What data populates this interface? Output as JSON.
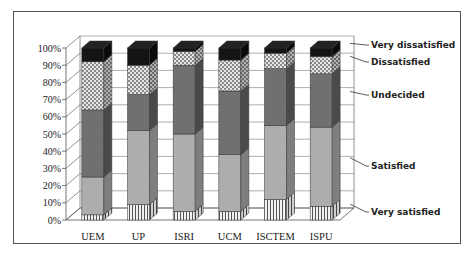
{
  "chart_data": {
    "type": "bar",
    "stacked": true,
    "percent_stacked": true,
    "three_d": true,
    "title": "",
    "xlabel": "",
    "ylabel": "",
    "ylim": [
      0,
      100
    ],
    "y_ticks": [
      "0%",
      "10%",
      "20%",
      "30%",
      "40%",
      "50%",
      "60%",
      "70%",
      "80%",
      "90%",
      "100%"
    ],
    "grid": true,
    "legend_position": "right (callout labels)",
    "categories": [
      "UEM",
      "UP",
      "ISRI",
      "UCM",
      "ISCTEM",
      "ISPU"
    ],
    "series": [
      {
        "name": "Very satisfied",
        "values": [
          3,
          9,
          5,
          5,
          12,
          8
        ],
        "pattern": "vertical-stripes",
        "color": "#d8d8d8"
      },
      {
        "name": "Satisfied",
        "values": [
          22,
          43,
          45,
          33,
          43,
          46
        ],
        "pattern": "solid",
        "color": "#a9a9a9"
      },
      {
        "name": "Undecided",
        "values": [
          39,
          21,
          40,
          37,
          33,
          31
        ],
        "pattern": "solid",
        "color": "#6e6e6e"
      },
      {
        "name": "Dissatisfied",
        "values": [
          28,
          17,
          8,
          18,
          9,
          10
        ],
        "pattern": "checkered",
        "color": "#c8c8c8"
      },
      {
        "name": "Very dissatisfied",
        "values": [
          8,
          10,
          2,
          7,
          3,
          5
        ],
        "pattern": "solid",
        "color": "#111111"
      }
    ]
  },
  "axis": {
    "y_labels": [
      "0%",
      "10%",
      "20%",
      "30%",
      "40%",
      "50%",
      "60%",
      "70%",
      "80%",
      "90%",
      "100%"
    ]
  },
  "legend": {
    "very_dissatisfied": "Very dissatisfied",
    "dissatisfied": "Dissatisfied",
    "undecided": "Undecided",
    "satisfied": "Satisfied",
    "very_satisfied": "Very satisfied"
  },
  "categories": [
    "UEM",
    "UP",
    "ISRI",
    "UCM",
    "ISCTEM",
    "ISPU"
  ]
}
